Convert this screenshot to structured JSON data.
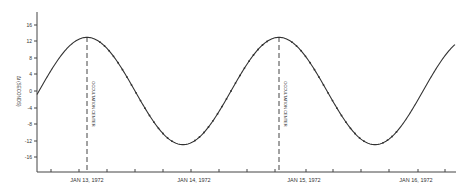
{
  "chart_data": {
    "type": "line",
    "title": "",
    "xlabel": "",
    "ylabel": "Δt (seconds)",
    "ylim": [
      -20,
      20
    ],
    "yticks": [
      16,
      12,
      8,
      4,
      0,
      -4,
      -8,
      -12,
      -16
    ],
    "xtick_labels": [
      "JAN 13, 1972",
      "JAN 14, 1972",
      "JAN 15, 1972",
      "JAN 16, 1972"
    ],
    "grid": false,
    "legend": null,
    "annotations": [
      {
        "text": "OCCULTATION CENTER",
        "x_px": 87,
        "style": "dashed-vertical"
      },
      {
        "text": "OCCULTATION CENTER",
        "x_px": 279,
        "style": "dashed-vertical"
      }
    ],
    "series": [
      {
        "name": "Δt",
        "description": "sinusoidal curve, amplitude ≈13 s, period ≈ 2 days, with observed data points along the descending and ascending segments",
        "points": [
          {
            "x_px": 37,
            "y": -1
          },
          {
            "x_px": 87,
            "y": 13
          },
          {
            "x_px": 135,
            "y": 0
          },
          {
            "x_px": 183,
            "y": -13
          },
          {
            "x_px": 231,
            "y": 0
          },
          {
            "x_px": 279,
            "y": 13
          },
          {
            "x_px": 327,
            "y": 0
          },
          {
            "x_px": 375,
            "y": -13
          },
          {
            "x_px": 423,
            "y": 0
          },
          {
            "x_px": 455,
            "y": 12
          }
        ]
      }
    ]
  },
  "labels": {
    "ylabel": "Δt (SECONDS)",
    "occ1": "OCCULTATION CENTER",
    "occ2": "OCCULTATION CENTER",
    "x1": "JAN 13, 1972",
    "x2": "JAN 14, 1972",
    "x3": "JAN 15, 1972",
    "x4": "JAN 16, 1972",
    "y16": "16",
    "y12": "12",
    "y8": "8",
    "y4": "4",
    "y0": "0",
    "ym4": "-4",
    "ym8": "-8",
    "ym12": "-12",
    "ym16": "-16"
  }
}
